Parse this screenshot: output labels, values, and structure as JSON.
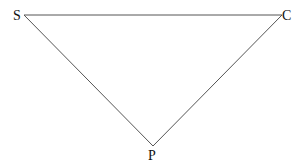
{
  "diagram": {
    "type": "triangle",
    "vertices": [
      {
        "label": "S",
        "x": 24,
        "y": 15
      },
      {
        "label": "C",
        "x": 282,
        "y": 15
      },
      {
        "label": "P",
        "x": 153,
        "y": 146
      }
    ],
    "edges": [
      [
        "S",
        "C"
      ],
      [
        "S",
        "P"
      ],
      [
        "C",
        "P"
      ]
    ],
    "line_color": "#555555"
  }
}
